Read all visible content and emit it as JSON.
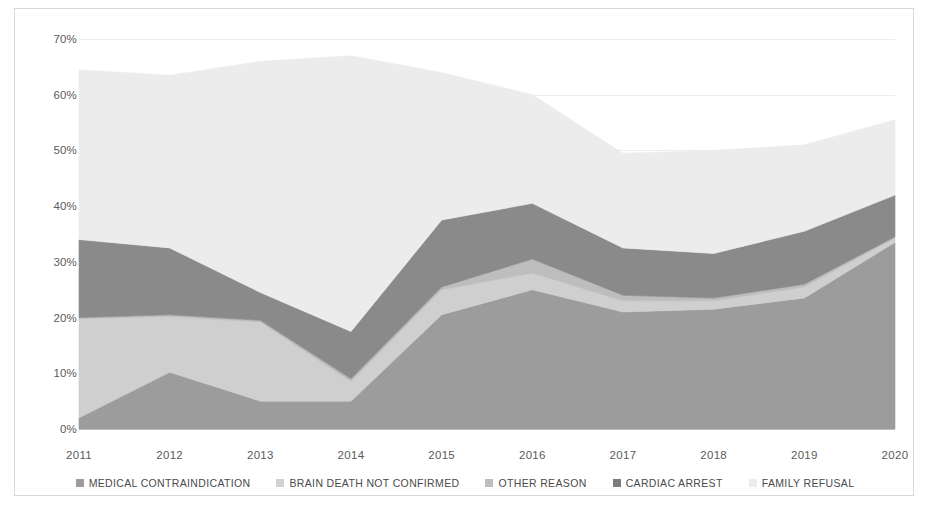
{
  "chart_data": {
    "type": "area",
    "stacked": true,
    "title": "",
    "xlabel": "",
    "ylabel": "",
    "categories": [
      "2011",
      "2012",
      "2013",
      "2014",
      "2015",
      "2016",
      "2017",
      "2018",
      "2019",
      "2020"
    ],
    "ylim": [
      0,
      70
    ],
    "ytick_labels": [
      "0%",
      "10%",
      "20%",
      "30%",
      "40%",
      "50%",
      "60%",
      "70%"
    ],
    "ytick_values": [
      0,
      10,
      20,
      30,
      40,
      50,
      60,
      70
    ],
    "grid": true,
    "legend_position": "bottom",
    "series": [
      {
        "name": "MEDICAL CONTRAINDICATION",
        "color": "#9c9c9c",
        "values": [
          2.0,
          10.2,
          5.0,
          5.0,
          20.5,
          25.0,
          21.0,
          21.5,
          23.5,
          33.5
        ]
      },
      {
        "name": "BRAIN DEATH NOT CONFIRMED",
        "color": "#cfcfcf",
        "values": [
          17.8,
          10.0,
          14.2,
          3.5,
          4.5,
          3.0,
          2.0,
          1.5,
          2.0,
          0.8
        ]
      },
      {
        "name": "OTHER REASON",
        "color": "#bdbdbd",
        "values": [
          0.2,
          0.3,
          0.3,
          0.5,
          0.5,
          2.5,
          1.0,
          0.5,
          0.5,
          0.2
        ]
      },
      {
        "name": "CARDIAC ARREST",
        "color": "#8a8a8a",
        "values": [
          14.0,
          12.0,
          5.0,
          8.5,
          12.0,
          10.0,
          8.5,
          8.0,
          9.5,
          7.5
        ]
      },
      {
        "name": "FAMILY REFUSAL",
        "color": "#ececec",
        "values": [
          30.5,
          31.0,
          41.5,
          49.5,
          26.5,
          19.5,
          17.0,
          18.5,
          15.5,
          13.5
        ]
      }
    ],
    "cumulative_tops": {
      "medical_contraindication": [
        2.0,
        10.2,
        5.0,
        5.0,
        20.5,
        25.0,
        21.0,
        21.5,
        23.5,
        33.5
      ],
      "brain_death_not_confirmed": [
        19.8,
        20.2,
        19.2,
        8.5,
        25.0,
        28.0,
        23.0,
        23.0,
        25.5,
        34.3
      ],
      "other_reason": [
        20.0,
        20.5,
        19.5,
        9.0,
        25.5,
        30.5,
        24.0,
        23.5,
        26.0,
        34.5
      ],
      "cardiac_arrest": [
        34.0,
        32.5,
        24.5,
        17.5,
        37.5,
        40.5,
        32.5,
        31.5,
        35.5,
        42.0
      ],
      "family_refusal": [
        64.5,
        63.5,
        66.0,
        67.0,
        64.0,
        60.0,
        49.5,
        50.0,
        51.0,
        55.5
      ]
    }
  },
  "legend": {
    "items": [
      {
        "label": "MEDICAL CONTRAINDICATION",
        "color": "#9c9c9c"
      },
      {
        "label": "BRAIN DEATH NOT CONFIRMED",
        "color": "#d2d2d2"
      },
      {
        "label": "OTHER REASON",
        "color": "#bdbdbd"
      },
      {
        "label": "CARDIAC ARREST",
        "color": "#7d7d7d"
      },
      {
        "label": "FAMILY REFUSAL",
        "color": "#ececec"
      }
    ]
  }
}
